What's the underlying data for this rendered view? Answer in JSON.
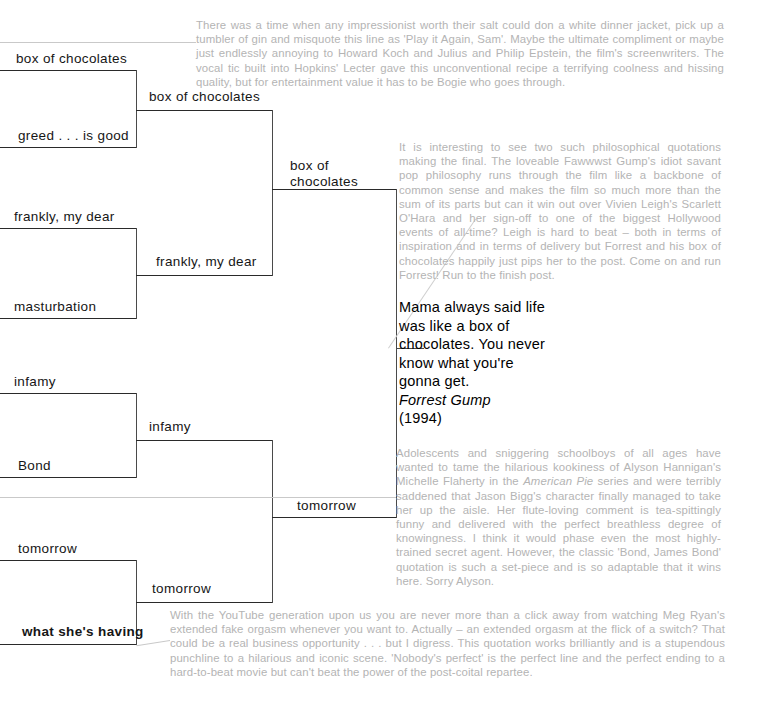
{
  "bracket": {
    "round1": [
      {
        "label": "box of chocolates"
      },
      {
        "label": "greed . . . is good"
      },
      {
        "label": "frankly, my dear"
      },
      {
        "label": "masturbation"
      },
      {
        "label": "infamy"
      },
      {
        "label": "Bond"
      },
      {
        "label": "tomorrow"
      },
      {
        "label": "what she's having"
      }
    ],
    "round2": [
      {
        "label": "box of chocolates"
      },
      {
        "label": "frankly, my dear"
      },
      {
        "label": "infamy"
      },
      {
        "label": "tomorrow"
      }
    ],
    "round3": [
      {
        "label": "box of",
        "label2": "chocolates"
      },
      {
        "label": "tomorrow"
      }
    ]
  },
  "winner": {
    "quote": "Mama always said life was like a box of chocolates. You never know what you're gonna get.",
    "film": "Forrest Gump",
    "year": "(1994)"
  },
  "notes": {
    "top": "There was a time when any impressionist worth their salt could don a white dinner jacket, pick up a tumbler of gin and misquote this line as 'Play it Again, Sam'. Maybe the ultimate compliment or maybe just endlessly annoying to Howard Koch and Julius and Philip Epstein, the film's screenwriters. The vocal tic built into Hopkins' Lecter gave this unconventional recipe a terrifying coolness and hissing quality, but for entertainment value it has to be Bogie who goes through.",
    "upper_right": "It is interesting to see two such philosophical quotations making the final. The loveable Fawwwst Gump's idiot savant pop philosophy runs through the film like a backbone of common sense and makes the film so much more than the sum of its parts but can it win out over Vivien Leigh's Scarlett O'Hara and her sign-off to one of the biggest Hollywood events of all-time? Leigh is hard to beat – both in terms of inspiration and in terms of delivery but Forrest and his box of chocolates happily just pips her to the post. Come on and run Forrest! Run to the finish post.",
    "lower_right_a": "Adolescents and sniggering schoolboys of all ages have wanted to tame the hilarious kookiness of Alyson Hannigan's Michelle Flaherty in the ",
    "lower_right_film": "American Pie",
    "lower_right_b": " series and were terribly saddened that Jason Bigg's character finally managed to take her up the aisle. Her flute-loving comment is tea-spittingly funny and delivered with the perfect breathless degree of knowingness. I think it would phase even the most highly-trained secret agent. However, the classic 'Bond, James Bond' quotation is such a set-piece and is so adaptable that it wins here. Sorry Alyson.",
    "bottom": "With the YouTube generation upon us you are never more than a click away from watching Meg Ryan's extended fake orgasm whenever you want to. Actually – an extended orgasm at the flick of a switch? That could be a real business opportunity . . . but I digress. This quotation works brilliantly and is a stupendous punchline to a hilarious and iconic scene. 'Nobody's perfect' is the perfect line and the perfect ending to a hard-to-beat movie but can't beat the power of the post-coital repartee."
  },
  "colors": {
    "line": "#4a4a4a",
    "rule": "#2a2a2a",
    "leader": "#c9c9c9",
    "note_text": "#b4b4b4",
    "label_text": "#161616"
  }
}
